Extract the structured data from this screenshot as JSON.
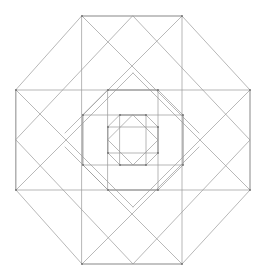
{
  "figure": {
    "background_color": "#ffffff",
    "stroke_color": "#9a9a9a",
    "vertex_color": "#6f6f6f",
    "stroke_width": 0.7,
    "vertex_radius": 0.9,
    "canvas": {
      "width": 269,
      "height": 280
    },
    "center": {
      "x": 133,
      "y": 140
    }
  },
  "geometry": {
    "ring_labels": [
      "outer",
      "middle",
      "inner",
      "core"
    ],
    "ring_radii": [
      124,
      62,
      31,
      15.5
    ],
    "vertices": {
      "outer": [
        {
          "name": "outer-n-left",
          "x": 82,
          "y": 16
        },
        {
          "name": "outer-n-right",
          "x": 182,
          "y": 16
        },
        {
          "name": "outer-e-top",
          "x": 250,
          "y": 90
        },
        {
          "name": "outer-e-bot",
          "x": 250,
          "y": 190
        },
        {
          "name": "outer-s-right",
          "x": 182,
          "y": 264
        },
        {
          "name": "outer-s-left",
          "x": 82,
          "y": 264
        },
        {
          "name": "outer-w-bot",
          "x": 16,
          "y": 190
        },
        {
          "name": "outer-w-top",
          "x": 16,
          "y": 90
        }
      ],
      "middle": [
        {
          "name": "mid-n-left",
          "x": 108,
          "y": 90
        },
        {
          "name": "mid-n-right",
          "x": 158,
          "y": 90
        },
        {
          "name": "mid-e-top",
          "x": 183,
          "y": 115
        },
        {
          "name": "mid-e-bot",
          "x": 183,
          "y": 165
        },
        {
          "name": "mid-s-right",
          "x": 158,
          "y": 190
        },
        {
          "name": "mid-s-left",
          "x": 108,
          "y": 190
        },
        {
          "name": "mid-w-bot",
          "x": 83,
          "y": 165
        },
        {
          "name": "mid-w-top",
          "x": 83,
          "y": 115
        }
      ],
      "inner": [
        {
          "name": "inner-n-left",
          "x": 120,
          "y": 115
        },
        {
          "name": "inner-n-right",
          "x": 146,
          "y": 115
        },
        {
          "name": "inner-e-top",
          "x": 158,
          "y": 127
        },
        {
          "name": "inner-e-bot",
          "x": 158,
          "y": 153
        },
        {
          "name": "inner-s-right",
          "x": 146,
          "y": 165
        },
        {
          "name": "inner-s-left",
          "x": 120,
          "y": 165
        },
        {
          "name": "inner-w-bot",
          "x": 108,
          "y": 153
        },
        {
          "name": "inner-w-top",
          "x": 108,
          "y": 127
        }
      ]
    },
    "polygons": {
      "outer_octagon": "82,16 182,16 250,90 250,190 182,264 82,264 16,190 16,90",
      "outer_square_axis": "16,90 250,90 250,190 16,190",
      "outer_square_vert": "82,16 182,16 182,264 82,264",
      "outer_diamond_large": "133,16 250,140 133,264 16,140",
      "middle_octagon": "108,90 158,90 183,115 183,165 158,190 108,190 83,165 83,115",
      "middle_square_axis": "83,115 183,115 183,165 83,165",
      "middle_square_vert": "108,90 158,90 158,190 108,190",
      "inner_octagon": "120,115 146,115 158,127 158,153 146,165 120,165 108,153 108,127",
      "inner_square_axis": "108,127 158,127 158,153 108,153",
      "inner_square_vert": "120,115 146,115 146,165 120,165",
      "core_diamond": "133,115 158,140 133,165 108,140"
    },
    "diagonals": [
      {
        "name": "diag-tl-main",
        "x1": 16,
        "y1": 90,
        "x2": 133,
        "y2": 207
      },
      {
        "name": "diag-tr-main",
        "x1": 250,
        "y1": 90,
        "x2": 133,
        "y2": 207
      },
      {
        "name": "diag-bl-main",
        "x1": 16,
        "y1": 190,
        "x2": 133,
        "y2": 73
      },
      {
        "name": "diag-br-main",
        "x1": 250,
        "y1": 190,
        "x2": 133,
        "y2": 73
      },
      {
        "name": "diag-tn-left",
        "x1": 82,
        "y1": 16,
        "x2": 199,
        "y2": 133
      },
      {
        "name": "diag-tn-right",
        "x1": 182,
        "y1": 16,
        "x2": 65,
        "y2": 133
      },
      {
        "name": "diag-bs-left",
        "x1": 82,
        "y1": 264,
        "x2": 199,
        "y2": 147
      },
      {
        "name": "diag-bs-right",
        "x1": 182,
        "y1": 264,
        "x2": 65,
        "y2": 147
      }
    ]
  }
}
